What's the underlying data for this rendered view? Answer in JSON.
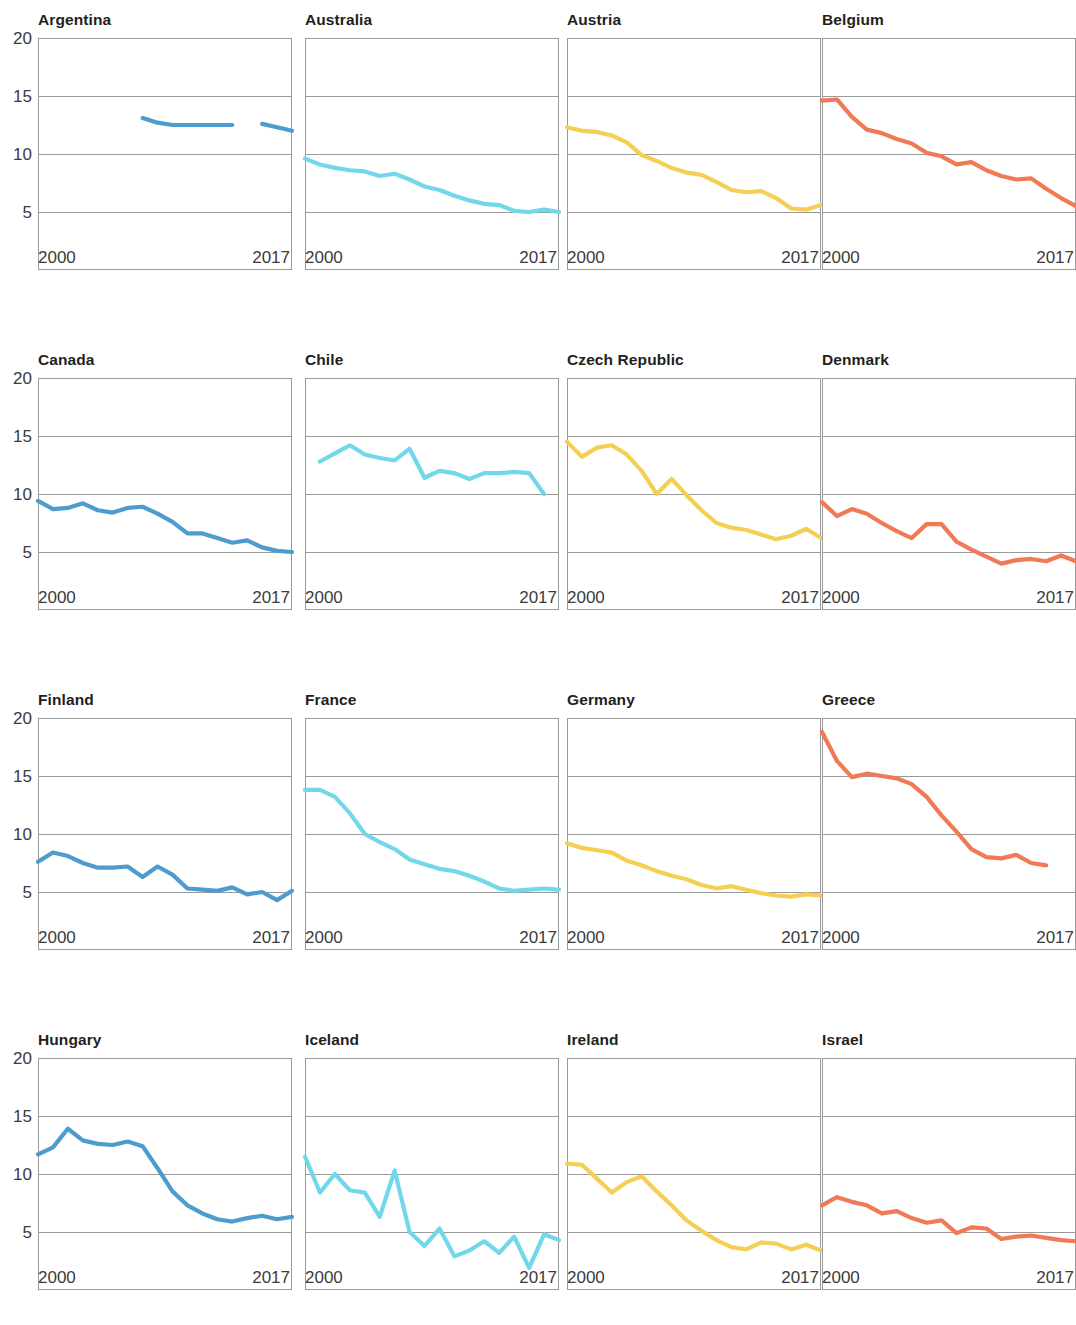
{
  "figure": {
    "columns": 4,
    "rows": 4,
    "y_ticks": [
      "20",
      "15",
      "10",
      "5"
    ],
    "x_tick_start": "2000",
    "x_tick_end": "2017",
    "series_colors": {
      "blue": "#4e9bcd",
      "cyan": "#73d7ec",
      "yellow": "#f5cf54",
      "orange": "#ef7a55"
    },
    "grid_color": "#9a9a9a",
    "axis_color": "#9a9a9a"
  },
  "chart_data": [
    {
      "type": "line",
      "title": "Argentina",
      "xlabel": "",
      "ylabel": "",
      "xlim": [
        2000,
        2017
      ],
      "ylim": [
        0,
        20
      ],
      "yticks": [
        5,
        10,
        15,
        20
      ],
      "xticks": [
        2000,
        2017
      ],
      "grid": true,
      "color": "#4e9bcd",
      "x": [
        2007,
        2008,
        2009,
        2010,
        2011,
        2012,
        2013,
        2014,
        2015,
        2016,
        2017
      ],
      "values": [
        13.1,
        12.7,
        12.5,
        12.5,
        12.5,
        12.5,
        12.5,
        null,
        12.6,
        12.3,
        12.0
      ]
    },
    {
      "type": "line",
      "title": "Australia",
      "xlim": [
        2000,
        2017
      ],
      "ylim": [
        0,
        20
      ],
      "color": "#73d7ec",
      "x": [
        2000,
        2001,
        2002,
        2003,
        2004,
        2005,
        2006,
        2007,
        2008,
        2009,
        2010,
        2011,
        2012,
        2013,
        2014,
        2015,
        2016,
        2017
      ],
      "values": [
        9.6,
        9.1,
        8.8,
        8.6,
        8.5,
        8.1,
        8.3,
        7.8,
        7.2,
        6.9,
        6.4,
        6.0,
        5.7,
        5.6,
        5.1,
        5.0,
        5.2,
        5.0
      ]
    },
    {
      "type": "line",
      "title": "Austria",
      "xlim": [
        2000,
        2017
      ],
      "ylim": [
        0,
        20
      ],
      "color": "#f5cf54",
      "x": [
        2000,
        2001,
        2002,
        2003,
        2004,
        2005,
        2006,
        2007,
        2008,
        2009,
        2010,
        2011,
        2012,
        2013,
        2014,
        2015,
        2016,
        2017
      ],
      "values": [
        12.3,
        12.0,
        11.9,
        11.6,
        11.0,
        9.9,
        9.4,
        8.8,
        8.4,
        8.2,
        7.6,
        6.9,
        6.7,
        6.8,
        6.2,
        5.3,
        5.2,
        5.6,
        5.0
      ]
    },
    {
      "type": "line",
      "title": "Belgium",
      "xlim": [
        2000,
        2017
      ],
      "ylim": [
        0,
        20
      ],
      "color": "#ef7a55",
      "x": [
        2000,
        2001,
        2002,
        2003,
        2004,
        2005,
        2006,
        2007,
        2008,
        2009,
        2010,
        2011,
        2012,
        2013,
        2014,
        2015,
        2016,
        2017
      ],
      "values": [
        14.6,
        14.7,
        13.2,
        12.1,
        11.8,
        11.3,
        10.9,
        10.1,
        9.8,
        9.1,
        9.3,
        8.6,
        8.1,
        7.8,
        7.9,
        7.0,
        6.2,
        5.5
      ]
    },
    {
      "type": "line",
      "title": "Canada",
      "xlim": [
        2000,
        2017
      ],
      "ylim": [
        0,
        20
      ],
      "color": "#4e9bcd",
      "x": [
        2000,
        2001,
        2002,
        2003,
        2004,
        2005,
        2006,
        2007,
        2008,
        2009,
        2010,
        2011,
        2012,
        2013,
        2014,
        2015,
        2016,
        2017
      ],
      "values": [
        9.4,
        8.7,
        8.8,
        9.2,
        8.6,
        8.4,
        8.8,
        8.9,
        8.3,
        7.6,
        6.6,
        6.6,
        6.2,
        5.8,
        6.0,
        5.4,
        5.1,
        5.0,
        4.9
      ]
    },
    {
      "type": "line",
      "title": "Chile",
      "xlim": [
        2000,
        2017
      ],
      "ylim": [
        0,
        20
      ],
      "color": "#73d7ec",
      "x": [
        2001,
        2002,
        2003,
        2004,
        2005,
        2006,
        2007,
        2008,
        2009,
        2010,
        2011,
        2012,
        2013,
        2014,
        2015,
        2016
      ],
      "values": [
        12.8,
        13.5,
        14.2,
        13.4,
        13.1,
        12.9,
        13.9,
        11.4,
        12.0,
        11.8,
        11.3,
        11.8,
        11.8,
        11.9,
        11.8,
        10.0
      ]
    },
    {
      "type": "line",
      "title": "Czech Republic",
      "xlim": [
        2000,
        2017
      ],
      "ylim": [
        0,
        20
      ],
      "color": "#f5cf54",
      "x": [
        2000,
        2001,
        2002,
        2003,
        2004,
        2005,
        2006,
        2007,
        2008,
        2009,
        2010,
        2011,
        2012,
        2013,
        2014,
        2015,
        2016,
        2017
      ],
      "values": [
        14.5,
        13.2,
        14.0,
        14.2,
        13.4,
        12.0,
        10.0,
        11.3,
        9.9,
        8.6,
        7.5,
        7.1,
        6.9,
        6.5,
        6.1,
        6.4,
        7.0,
        6.2,
        5.6
      ]
    },
    {
      "type": "line",
      "title": "Denmark",
      "xlim": [
        2000,
        2017
      ],
      "ylim": [
        0,
        20
      ],
      "color": "#ef7a55",
      "x": [
        2000,
        2001,
        2002,
        2003,
        2004,
        2005,
        2006,
        2007,
        2008,
        2009,
        2010,
        2011,
        2012,
        2013,
        2014,
        2015,
        2016,
        2017
      ],
      "values": [
        9.3,
        8.1,
        8.7,
        8.3,
        7.5,
        6.8,
        6.2,
        7.4,
        7.4,
        5.9,
        5.2,
        4.6,
        4.0,
        4.3,
        4.4,
        4.2,
        4.7,
        4.2
      ]
    },
    {
      "type": "line",
      "title": "Finland",
      "xlim": [
        2000,
        2017
      ],
      "ylim": [
        0,
        20
      ],
      "color": "#4e9bcd",
      "x": [
        2000,
        2001,
        2002,
        2003,
        2004,
        2005,
        2006,
        2007,
        2008,
        2009,
        2010,
        2011,
        2012,
        2013,
        2014,
        2015,
        2016,
        2017
      ],
      "values": [
        7.6,
        8.4,
        8.1,
        7.5,
        7.1,
        7.1,
        7.2,
        6.3,
        7.2,
        6.5,
        5.3,
        5.2,
        5.1,
        5.4,
        4.8,
        5.0,
        4.3,
        5.1,
        4.9,
        4.4
      ]
    },
    {
      "type": "line",
      "title": "France",
      "xlim": [
        2000,
        2017
      ],
      "ylim": [
        0,
        20
      ],
      "color": "#73d7ec",
      "x": [
        2000,
        2001,
        2002,
        2003,
        2004,
        2005,
        2006,
        2007,
        2008,
        2009,
        2010,
        2011,
        2012,
        2013,
        2014,
        2015,
        2016,
        2017
      ],
      "values": [
        13.8,
        13.8,
        13.2,
        11.8,
        10.0,
        9.3,
        8.7,
        7.8,
        7.4,
        7.0,
        6.8,
        6.4,
        5.9,
        5.3,
        5.1,
        5.2,
        5.3,
        5.2
      ]
    },
    {
      "type": "line",
      "title": "Germany",
      "xlim": [
        2000,
        2017
      ],
      "ylim": [
        0,
        20
      ],
      "color": "#f5cf54",
      "x": [
        2000,
        2001,
        2002,
        2003,
        2004,
        2005,
        2006,
        2007,
        2008,
        2009,
        2010,
        2011,
        2012,
        2013,
        2014,
        2015,
        2016,
        2017
      ],
      "values": [
        9.2,
        8.8,
        8.6,
        8.4,
        7.7,
        7.3,
        6.8,
        6.4,
        6.1,
        5.6,
        5.3,
        5.5,
        5.2,
        4.9,
        4.7,
        4.6,
        4.8,
        4.7,
        4.3
      ]
    },
    {
      "type": "line",
      "title": "Greece",
      "xlim": [
        2000,
        2017
      ],
      "ylim": [
        0,
        20
      ],
      "color": "#ef7a55",
      "x": [
        2000,
        2001,
        2002,
        2003,
        2004,
        2005,
        2006,
        2007,
        2008,
        2009,
        2010,
        2011,
        2012,
        2013,
        2014,
        2015,
        2016,
        2017
      ],
      "values": [
        18.8,
        16.3,
        14.9,
        15.2,
        15.0,
        14.8,
        14.3,
        13.2,
        11.6,
        10.2,
        8.7,
        8.0,
        7.9,
        8.2,
        7.5,
        7.3
      ]
    },
    {
      "type": "line",
      "title": "Hungary",
      "xlim": [
        2000,
        2017
      ],
      "ylim": [
        0,
        20
      ],
      "color": "#4e9bcd",
      "x": [
        2000,
        2001,
        2002,
        2003,
        2004,
        2005,
        2006,
        2007,
        2008,
        2009,
        2010,
        2011,
        2012,
        2013,
        2014,
        2015,
        2016,
        2017
      ],
      "values": [
        11.7,
        12.3,
        13.9,
        12.9,
        12.6,
        12.5,
        12.8,
        12.4,
        10.5,
        8.5,
        7.3,
        6.6,
        6.1,
        5.9,
        6.2,
        6.4,
        6.1,
        6.3
      ]
    },
    {
      "type": "line",
      "title": "Iceland",
      "xlim": [
        2000,
        2017
      ],
      "ylim": [
        0,
        20
      ],
      "color": "#73d7ec",
      "x": [
        2000,
        2001,
        2002,
        2003,
        2004,
        2005,
        2006,
        2007,
        2008,
        2009,
        2010,
        2011,
        2012,
        2013,
        2014,
        2015,
        2016,
        2017
      ],
      "values": [
        11.5,
        8.4,
        10.0,
        8.6,
        8.4,
        6.3,
        10.3,
        5.0,
        3.8,
        5.3,
        2.9,
        3.4,
        4.2,
        3.2,
        4.6,
        1.9,
        4.8,
        4.3,
        4.9
      ]
    },
    {
      "type": "line",
      "title": "Ireland",
      "xlim": [
        2000,
        2017
      ],
      "ylim": [
        0,
        20
      ],
      "color": "#f5cf54",
      "x": [
        2000,
        2001,
        2002,
        2003,
        2004,
        2005,
        2006,
        2007,
        2008,
        2009,
        2010,
        2011,
        2012,
        2013,
        2014,
        2015,
        2016,
        2017
      ],
      "values": [
        10.9,
        10.8,
        9.6,
        8.4,
        9.3,
        9.8,
        8.5,
        7.3,
        6.0,
        5.1,
        4.3,
        3.7,
        3.5,
        4.1,
        4.0,
        3.5,
        3.9,
        3.4
      ]
    },
    {
      "type": "line",
      "title": "Israel",
      "xlim": [
        2000,
        2017
      ],
      "ylim": [
        0,
        20
      ],
      "color": "#ef7a55",
      "x": [
        2000,
        2001,
        2002,
        2003,
        2004,
        2005,
        2006,
        2007,
        2008,
        2009,
        2010,
        2011,
        2012,
        2013,
        2014,
        2015,
        2016,
        2017
      ],
      "values": [
        7.3,
        8.0,
        7.6,
        7.3,
        6.6,
        6.8,
        6.2,
        5.8,
        6.0,
        4.9,
        5.4,
        5.3,
        4.4,
        4.6,
        4.7,
        4.5,
        4.3,
        4.2
      ]
    }
  ]
}
